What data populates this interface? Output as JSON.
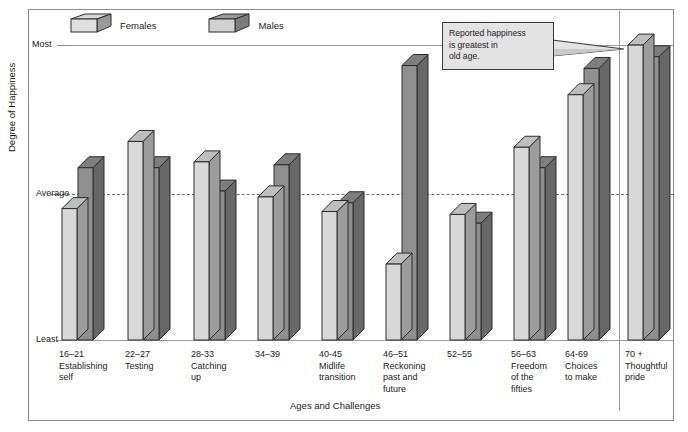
{
  "top_strip_text": "",
  "chart_data": {
    "type": "bar",
    "title": "",
    "xlabel": "Ages and Challenges",
    "ylabel": "Degree of Happiness",
    "y_ticks": [
      "Most",
      "Average",
      "Least"
    ],
    "ylim": [
      0,
      100
    ],
    "grid": "average-line-dashed",
    "legend_position": "top-left",
    "legend": [
      "Females",
      "Males"
    ],
    "colors": {
      "females": "#d8d8d8",
      "males": "#8f8f8f",
      "outline": "#2c2c2c",
      "frame": "#8d8d8d"
    },
    "categories": [
      "16–21 Establishing self",
      "22–27 Testing",
      "28-33 Catching up",
      "34–39",
      "40-45 Midlife transition",
      "46–51 Reckoning past and future",
      "52–55",
      "56–63 Freedom of the fifties",
      "64-69 Choices to make",
      "70 + Thoughtful pride"
    ],
    "series": [
      {
        "name": "Females",
        "values": [
          45,
          68,
          61,
          49,
          44,
          26,
          43,
          66,
          84,
          101
        ]
      },
      {
        "name": "Males",
        "values": [
          59,
          59,
          51,
          60,
          47,
          94,
          40,
          59,
          93,
          97
        ]
      }
    ],
    "annotations": [
      {
        "text": "Reported happiness is greatest in old age.",
        "points_to": "70 + Thoughtful pride"
      }
    ]
  },
  "axis": {
    "ticks": [
      {
        "label": "Most"
      },
      {
        "label": "Average"
      },
      {
        "label": "Least"
      }
    ],
    "x_title": "Ages and Challenges",
    "y_title": "Degree of Happiness"
  },
  "legend": {
    "items": [
      {
        "label": "Females"
      },
      {
        "label": "Males"
      }
    ]
  },
  "groups": [
    {
      "range": "16–21",
      "line2": "Establishing",
      "line3": "self"
    },
    {
      "range": "22–27",
      "line2": "Testing",
      "line3": ""
    },
    {
      "range": "28-33",
      "line2": "Catching",
      "line3": "up"
    },
    {
      "range": "34–39",
      "line2": "",
      "line3": ""
    },
    {
      "range": "40-45",
      "line2": "Midlife",
      "line3": "transition"
    },
    {
      "range": "46–51",
      "line2": "Reckoning",
      "line3": "past and",
      "line4": "future"
    },
    {
      "range": "52–55",
      "line2": "",
      "line3": ""
    },
    {
      "range": "56–63",
      "line2": "Freedom",
      "line3": "of the",
      "line4": "fifties"
    },
    {
      "range": "64-69",
      "line2": "Choices",
      "line3": "to make",
      "line4": ""
    },
    {
      "range": "70 +",
      "line2": "Thoughtful",
      "line3": "pride",
      "line4": ""
    }
  ],
  "callout": {
    "line1": "Reported happiness",
    "line2": "is greatest in",
    "line3": "old age."
  }
}
